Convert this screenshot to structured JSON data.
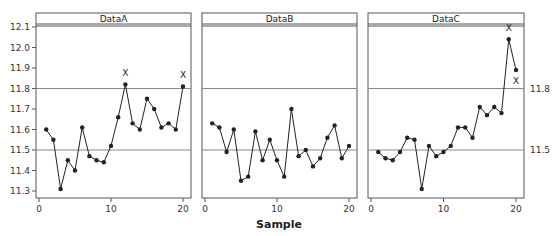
{
  "chart_data": {
    "type": "line",
    "title": "",
    "xlabel": "Sample",
    "ylabel": "",
    "ylim": [
      11.28,
      12.12
    ],
    "xlim": [
      0,
      21
    ],
    "y_ticks": [
      11.3,
      11.4,
      11.5,
      11.6,
      11.7,
      11.8,
      11.9,
      12.0,
      12.1
    ],
    "y_tick_labels": [
      "11.3",
      "11.4",
      "11.5",
      "11.6",
      "11.7",
      "11.8",
      "11.9",
      "12.0",
      "12.1"
    ],
    "x_ticks": [
      0,
      10,
      20
    ],
    "x_tick_labels": [
      "0",
      "10",
      "20"
    ],
    "reference_lines": [
      11.5,
      11.8
    ],
    "right_axis_labels": [
      {
        "value": 11.8,
        "label": "11.8"
      },
      {
        "value": 11.5,
        "label": "11.5"
      }
    ],
    "grid": false,
    "legend": "none",
    "x": [
      1,
      2,
      3,
      4,
      5,
      6,
      7,
      8,
      9,
      10,
      11,
      12,
      13,
      14,
      15,
      16,
      17,
      18,
      19,
      20
    ],
    "panels": [
      {
        "name": "DataA",
        "values": [
          11.6,
          11.55,
          11.31,
          11.45,
          11.4,
          11.61,
          11.47,
          11.45,
          11.44,
          11.52,
          11.66,
          11.82,
          11.63,
          11.6,
          11.75,
          11.7,
          11.61,
          11.63,
          11.6,
          11.81
        ],
        "flags": [
          {
            "sample": 12,
            "label": "X",
            "position": "above"
          },
          {
            "sample": 20,
            "label": "X",
            "position": "above"
          }
        ]
      },
      {
        "name": "DataB",
        "values": [
          11.63,
          11.61,
          11.49,
          11.6,
          11.35,
          11.37,
          11.59,
          11.45,
          11.55,
          11.45,
          11.37,
          11.7,
          11.47,
          11.5,
          11.42,
          11.46,
          11.56,
          11.62,
          11.46,
          11.52
        ],
        "flags": []
      },
      {
        "name": "DataC",
        "values": [
          11.49,
          11.46,
          11.45,
          11.49,
          11.56,
          11.55,
          11.31,
          11.52,
          11.47,
          11.49,
          11.52,
          11.61,
          11.61,
          11.56,
          11.71,
          11.67,
          11.71,
          11.68,
          12.04,
          11.89
        ],
        "flags": [
          {
            "sample": 19,
            "label": "X",
            "position": "above"
          },
          {
            "sample": 20,
            "label": "X",
            "position": "below"
          }
        ]
      }
    ]
  },
  "colors": {
    "line": "#222222",
    "reference_line": "#888888",
    "frame": "#555555"
  }
}
